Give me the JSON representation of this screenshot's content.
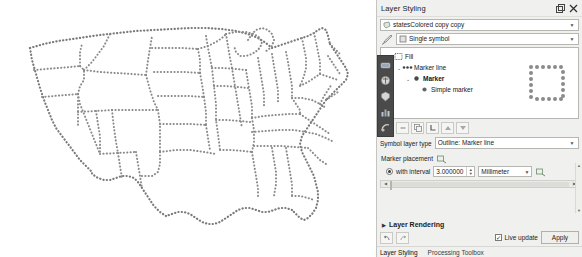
{
  "panel": {
    "title": "Layer Styling",
    "title_buttons": [
      {
        "name": "undock-button",
        "glyph": "float"
      },
      {
        "name": "close-button",
        "glyph": "close"
      }
    ],
    "layer_selector": {
      "value": "statesColored copy copy",
      "icon": "polygon-layer-icon"
    },
    "renderer_selector": {
      "value": "Single symbol",
      "icon": "single-symbol-icon"
    },
    "symbol_tree": [
      {
        "depth": 1,
        "label": "Fill",
        "icon": "fill-icon",
        "expanded": true,
        "bold": false
      },
      {
        "depth": 2,
        "label": "Marker line",
        "icon": "marker-line-icon",
        "expanded": true,
        "bold": false
      },
      {
        "depth": 3,
        "label": "Marker",
        "icon": "marker-icon",
        "expanded": true,
        "bold": true
      },
      {
        "depth": 4,
        "label": "Simple marker",
        "icon": "simple-marker-icon",
        "expanded": false,
        "bold": false
      }
    ],
    "preview": {
      "name": "symbol-preview",
      "description": "dotted square outline",
      "dot_color": "#8b8b8b"
    },
    "symbol_toolbar": [
      {
        "name": "add-symbol-layer-button",
        "glyph": "plus"
      },
      {
        "name": "remove-symbol-layer-button",
        "glyph": "minus"
      },
      {
        "name": "duplicate-symbol-layer-button",
        "glyph": "copy"
      },
      {
        "name": "lock-symbol-layer-button",
        "glyph": "lock"
      },
      {
        "name": "move-up-button",
        "glyph": "up"
      },
      {
        "name": "move-down-button",
        "glyph": "down"
      }
    ],
    "symbol_layer_type": {
      "label": "Symbol layer type",
      "value": "Outline: Marker line"
    },
    "marker_placement": {
      "label": "Marker placement",
      "data_defined_icon": "data-defined-override-icon",
      "interval_option": {
        "label": "with interval",
        "selected": true,
        "value": "3.000000",
        "unit": "Millimeter"
      }
    },
    "layer_rendering": {
      "label": "Layer Rendering",
      "expanded": false
    },
    "footer": {
      "undo_button": "undo-icon",
      "redo_button": "redo-icon",
      "live_update": {
        "label": "Live update",
        "checked": true
      },
      "apply_label": "Apply"
    },
    "tabs": [
      {
        "label": "Layer Styling",
        "active": true
      },
      {
        "label": "Processing Toolbox",
        "active": false
      }
    ],
    "rail_icons": [
      "symbology-icon",
      "labels-icon",
      "masks-icon",
      "diagrams-icon",
      "history-icon"
    ]
  },
  "map": {
    "name": "us-states-map",
    "dot_color": "#7a7a7a",
    "background": "#ffffff",
    "description": "United States state boundaries drawn as dotted marker lines"
  }
}
